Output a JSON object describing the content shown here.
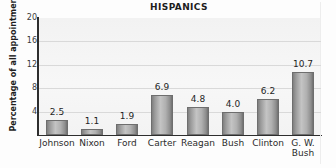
{
  "chart_data": {
    "type": "bar",
    "title": "HISPANICS",
    "xlabel": "",
    "ylabel": "Percentage of all appointments",
    "categories": [
      "Johnson",
      "Nixon",
      "Ford",
      "Carter",
      "Reagan",
      "Bush",
      "Clinton",
      "G. W. Bush"
    ],
    "category_lines": [
      [
        "Johnson"
      ],
      [
        "Nixon"
      ],
      [
        "Ford"
      ],
      [
        "Carter"
      ],
      [
        "Reagan"
      ],
      [
        "Bush"
      ],
      [
        "Clinton"
      ],
      [
        "G. W.",
        "Bush"
      ]
    ],
    "values": [
      2.5,
      1.1,
      1.9,
      6.9,
      4.8,
      4.0,
      6.2,
      10.7
    ],
    "value_labels": [
      "2.5",
      "1.1",
      "1.9",
      "6.9",
      "4.8",
      "4.0",
      "6.2",
      "10.7"
    ],
    "ylim": [
      0,
      20
    ],
    "yticks": [
      20,
      16,
      12,
      8,
      4
    ],
    "ytick_labels": [
      "20",
      "16",
      "12",
      "8",
      "4"
    ],
    "grid": true,
    "grid_axis": "y",
    "legend": null,
    "colors": {
      "bar_light": "#c4c4c4",
      "bar_dark": "#707070",
      "bar_edge": "#6e6e6e",
      "plot_background": "#f4f4f4",
      "gridline": "#d9d9d9",
      "axis": "#2e2e2e",
      "text": "#1f1f1f",
      "page_background": "#ffffff"
    }
  }
}
